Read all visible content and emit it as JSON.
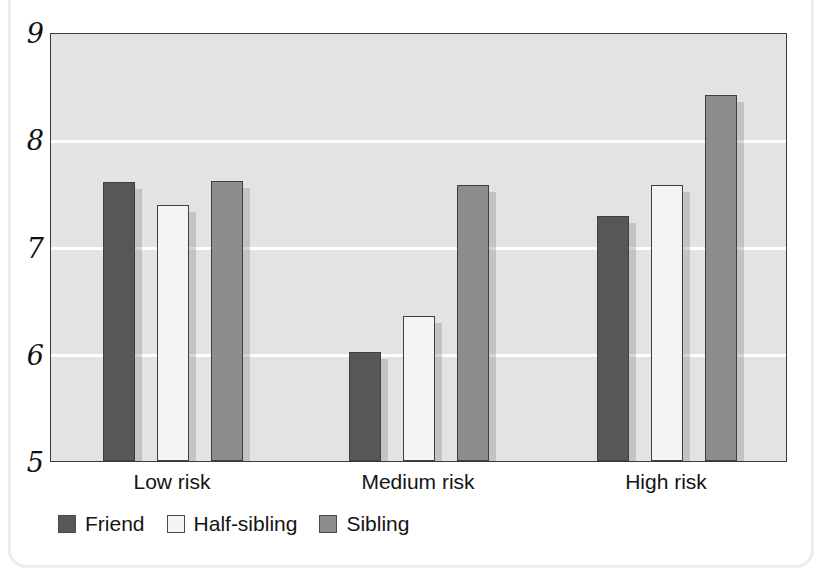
{
  "chart_data": {
    "type": "bar",
    "title": "",
    "subtitle": "",
    "xlabel": "",
    "ylabel": "",
    "categories": [
      "Low risk",
      "Medium risk",
      "High risk"
    ],
    "series": [
      {
        "name": "Friend",
        "color": "#575757",
        "values": [
          7.6,
          6.02,
          7.28
        ]
      },
      {
        "name": "Half-sibling",
        "color": "#f4f4f4",
        "values": [
          7.39,
          6.35,
          7.57
        ]
      },
      {
        "name": "Sibling",
        "color": "#8d8d8d",
        "values": [
          7.61,
          7.57,
          8.41
        ]
      }
    ],
    "ylim": [
      5,
      9
    ],
    "yticks": [
      5,
      6,
      7,
      8,
      9
    ],
    "ytick_labels": [
      "5",
      "6",
      "7",
      "8",
      "9"
    ],
    "grid": true,
    "gridline_color": "#ffffff",
    "plot_background": "#e3e3e3",
    "axis_color": "#3a3a3a",
    "legend_position": "bottom-left",
    "legend_entries": [
      "Friend",
      "Half-sibling",
      "Sibling"
    ]
  }
}
